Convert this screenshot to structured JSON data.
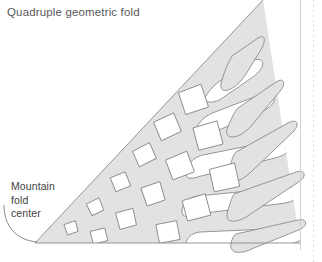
{
  "figure": {
    "title": "Quadruple geometric fold",
    "callout": {
      "line1": "Mountain",
      "line2": "fold",
      "line3": "center"
    },
    "colors": {
      "paper_fill": "#e2e2e2",
      "outline": "#8b8b8d",
      "cut_fill": "#ffffff",
      "title_text": "#58585a",
      "callout_text": "#3f3f41",
      "margin_rule": "#cfcfcf",
      "dotted_rule": "#d8d8d8"
    },
    "geometry": {
      "type": "right-triangle",
      "apex_top": [
        263,
        0
      ],
      "vertex_left": [
        35,
        243
      ],
      "vertex_right": [
        300,
        243
      ],
      "baseline_y": 243,
      "description": "Gray triangular folded paper with rows of rhombus cut-outs near the fold center that elongate into pointed petal slots toward the open edge."
    },
    "diamonds": [
      {
        "id": "d1",
        "cx": 193,
        "cy": 100,
        "w": 24,
        "h": 22,
        "rot": -16
      },
      {
        "id": "d2",
        "cx": 167,
        "cy": 127,
        "w": 22,
        "h": 19,
        "rot": -20
      },
      {
        "id": "d3",
        "cx": 144,
        "cy": 155,
        "w": 19,
        "h": 16,
        "rot": -24
      },
      {
        "id": "d4",
        "cx": 120,
        "cy": 182,
        "w": 16,
        "h": 14,
        "rot": -18
      },
      {
        "id": "d5",
        "cx": 95,
        "cy": 207,
        "w": 14,
        "h": 12,
        "rot": -22
      },
      {
        "id": "d6",
        "cx": 71,
        "cy": 228,
        "w": 12,
        "h": 10,
        "rot": -14
      },
      {
        "id": "d7",
        "cx": 208,
        "cy": 136,
        "w": 25,
        "h": 22,
        "rot": -12
      },
      {
        "id": "d8",
        "cx": 180,
        "cy": 166,
        "w": 23,
        "h": 20,
        "rot": -18
      },
      {
        "id": "d9",
        "cx": 153,
        "cy": 194,
        "w": 20,
        "h": 17,
        "rot": -16
      },
      {
        "id": "d10",
        "cx": 126,
        "cy": 219,
        "w": 18,
        "h": 15,
        "rot": -12
      },
      {
        "id": "d11",
        "cx": 99,
        "cy": 236,
        "w": 15,
        "h": 12,
        "rot": -10
      },
      {
        "id": "d12",
        "cx": 224,
        "cy": 178,
        "w": 26,
        "h": 22,
        "rot": -10
      },
      {
        "id": "d13",
        "cx": 196,
        "cy": 208,
        "w": 24,
        "h": 20,
        "rot": -12
      },
      {
        "id": "d14",
        "cx": 168,
        "cy": 232,
        "w": 21,
        "h": 17,
        "rot": -8
      }
    ],
    "petals": [
      {
        "id": "p1",
        "tip_x": 255,
        "tip_y": 40,
        "angle": -52
      },
      {
        "id": "p2",
        "tip_x": 278,
        "tip_y": 78,
        "angle": -38
      },
      {
        "id": "p3",
        "tip_x": 296,
        "tip_y": 116,
        "angle": -24
      },
      {
        "id": "p4",
        "tip_x": 302,
        "tip_y": 156,
        "angle": -12
      },
      {
        "id": "p5",
        "tip_x": 300,
        "tip_y": 196,
        "angle": -4
      },
      {
        "id": "p6",
        "tip_x": 292,
        "tip_y": 232,
        "angle": 4
      }
    ],
    "leader": {
      "from": [
        60,
        214
      ],
      "to": [
        37,
        241
      ],
      "style": "curved-arc"
    }
  }
}
